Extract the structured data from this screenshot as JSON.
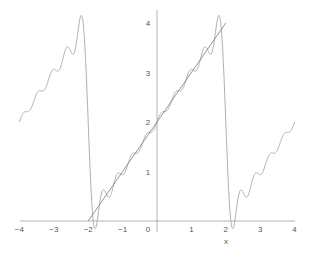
{
  "chart_data": {
    "type": "line",
    "title": "",
    "xlabel": "x",
    "ylabel": "",
    "xlim": [
      -4,
      4
    ],
    "ylim": [
      0,
      4.2
    ],
    "grid": false,
    "legend": null,
    "x_ticks": [
      "−4",
      "−3",
      "−2",
      "−1",
      "0",
      "1",
      "2",
      "3",
      "4"
    ],
    "x_tick_values": [
      -4,
      -3,
      -2,
      -1,
      0,
      1,
      2,
      3,
      4
    ],
    "y_ticks": [
      "1",
      "2",
      "3",
      "4"
    ],
    "y_tick_values": [
      1,
      2,
      3,
      4
    ],
    "series": [
      {
        "name": "Fourier partial sum (9 terms) of periodic x+2",
        "kind": "fourier",
        "terms": 9,
        "period": 4,
        "formula": "2 + sum_{n=1..9} (4/(n*pi)) * (-1)^(n+1) * sin(n*pi*x/2)",
        "color": "#b0b0b0",
        "x": [
          -4,
          -3.5,
          -3,
          -2.5,
          -2.2,
          -2,
          -1.8,
          -1.5,
          -1,
          -0.5,
          0,
          0.5,
          1,
          1.5,
          1.8,
          2,
          2.2,
          2.5,
          3,
          3.5,
          4
        ],
        "values": [
          2.0,
          2.53,
          3.06,
          3.43,
          4.15,
          2.0,
          -0.15,
          0.57,
          0.94,
          1.47,
          2.0,
          2.53,
          3.06,
          3.43,
          4.15,
          2.0,
          -0.15,
          0.57,
          0.94,
          1.47,
          2.0
        ]
      },
      {
        "name": "y = x + 2",
        "kind": "line",
        "color": "#7a7a7a",
        "x": [
          -2,
          2
        ],
        "values": [
          0,
          4
        ]
      }
    ]
  },
  "axes": {
    "x_label": "x",
    "tick_labels_x": [
      "−4",
      "−3",
      "−2",
      "−1",
      "0",
      "1",
      "2",
      "3",
      "4"
    ],
    "tick_labels_y": [
      "1",
      "2",
      "3",
      "4"
    ]
  },
  "colors": {
    "axis": "#a0a0a0",
    "tick_text": "#555555",
    "curve": "#b0b0b0",
    "line": "#7a7a7a"
  }
}
